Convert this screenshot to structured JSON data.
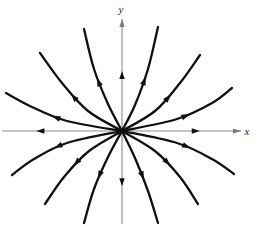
{
  "figure": {
    "width": 263,
    "height": 228,
    "background_color": "#ffffff"
  },
  "axes": {
    "x_label": "x",
    "y_label": "y",
    "origin": {
      "x": 122,
      "y": 131
    },
    "x_axis": {
      "x_min": 2,
      "x_max": 241,
      "y": 131,
      "color": "#8c8c8c"
    },
    "y_axis": {
      "y_min": 19,
      "y_max": 224,
      "x": 122,
      "color": "#8c8c8c"
    },
    "label_color": "#1a1a1a",
    "x_label_pos": {
      "x": 247,
      "y": 135
    },
    "y_label_pos": {
      "x": 121,
      "y": 13
    }
  },
  "style": {
    "trajectory_color": "#101010",
    "trajectory_width": 2.3,
    "axis_color": "#8c8c8c",
    "arrow_color": "#101010"
  },
  "chart_data": {
    "type": "line",
    "xlabel": "x",
    "ylabel": "y",
    "xlim": [
      -120,
      120
    ],
    "ylim": [
      -95,
      112
    ],
    "grid": false,
    "legend": false,
    "equilibrium": {
      "x": 0,
      "y": 0,
      "kind": "unstable-node",
      "stability": "unstable"
    },
    "flow_direction": "outward",
    "trajectory_count": 16,
    "axis_trajectory_count": 4,
    "curved_trajectory_count": 12,
    "trajectories": [
      {
        "name": "axis-right",
        "quadrant": "x+",
        "arrow_t": 0.62,
        "points": [
          [
            0,
            0
          ],
          [
            119,
            0
          ]
        ]
      },
      {
        "name": "axis-left",
        "quadrant": "x-",
        "arrow_t": 0.68,
        "points": [
          [
            0,
            0
          ],
          [
            -120,
            0
          ]
        ]
      },
      {
        "name": "axis-up",
        "quadrant": "y+",
        "arrow_t": 0.5,
        "points": [
          [
            0,
            0
          ],
          [
            0,
            112
          ]
        ]
      },
      {
        "name": "axis-down",
        "quadrant": "y-",
        "arrow_t": 0.55,
        "points": [
          [
            0,
            0
          ],
          [
            0,
            -93
          ]
        ]
      },
      {
        "name": "q1-shallow",
        "quadrant": "I",
        "arrow_t": 0.55,
        "points": [
          [
            0,
            0
          ],
          [
            55,
            12
          ],
          [
            90,
            28
          ],
          [
            110,
            43
          ]
        ]
      },
      {
        "name": "q1-middle",
        "quadrant": "I",
        "arrow_t": 0.52,
        "points": [
          [
            0,
            0
          ],
          [
            33,
            20
          ],
          [
            58,
            48
          ],
          [
            78,
            76
          ]
        ]
      },
      {
        "name": "q1-steep",
        "quadrant": "I",
        "arrow_t": 0.5,
        "points": [
          [
            0,
            0
          ],
          [
            13,
            26
          ],
          [
            26,
            62
          ],
          [
            36,
            104
          ]
        ]
      },
      {
        "name": "q2-shallow",
        "quadrant": "II",
        "arrow_t": 0.55,
        "points": [
          [
            0,
            0
          ],
          [
            -55,
            10
          ],
          [
            -90,
            24
          ],
          [
            -116,
            38
          ]
        ]
      },
      {
        "name": "q2-middle",
        "quadrant": "II",
        "arrow_t": 0.52,
        "points": [
          [
            0,
            0
          ],
          [
            -34,
            20
          ],
          [
            -60,
            48
          ],
          [
            -82,
            78
          ]
        ]
      },
      {
        "name": "q2-steep",
        "quadrant": "II",
        "arrow_t": 0.5,
        "points": [
          [
            0,
            0
          ],
          [
            -14,
            27
          ],
          [
            -28,
            62
          ],
          [
            -38,
            102
          ]
        ]
      },
      {
        "name": "q3-shallow",
        "quadrant": "III",
        "arrow_t": 0.55,
        "points": [
          [
            0,
            0
          ],
          [
            -55,
            -12
          ],
          [
            -88,
            -28
          ],
          [
            -110,
            -44
          ]
        ]
      },
      {
        "name": "q3-middle",
        "quadrant": "III",
        "arrow_t": 0.52,
        "points": [
          [
            0,
            0
          ],
          [
            -33,
            -20
          ],
          [
            -58,
            -46
          ],
          [
            -77,
            -73
          ]
        ]
      },
      {
        "name": "q3-steep",
        "quadrant": "III",
        "arrow_t": 0.5,
        "points": [
          [
            0,
            0
          ],
          [
            -14,
            -26
          ],
          [
            -28,
            -58
          ],
          [
            -38,
            -92
          ]
        ]
      },
      {
        "name": "q4-shallow",
        "quadrant": "IV",
        "arrow_t": 0.55,
        "points": [
          [
            0,
            0
          ],
          [
            55,
            -12
          ],
          [
            90,
            -28
          ],
          [
            112,
            -43
          ]
        ]
      },
      {
        "name": "q4-middle",
        "quadrant": "IV",
        "arrow_t": 0.52,
        "points": [
          [
            0,
            0
          ],
          [
            33,
            -20
          ],
          [
            58,
            -46
          ],
          [
            76,
            -73
          ]
        ]
      },
      {
        "name": "q4-steep",
        "quadrant": "IV",
        "arrow_t": 0.5,
        "points": [
          [
            0,
            0
          ],
          [
            13,
            -27
          ],
          [
            26,
            -60
          ],
          [
            36,
            -92
          ]
        ]
      }
    ]
  }
}
